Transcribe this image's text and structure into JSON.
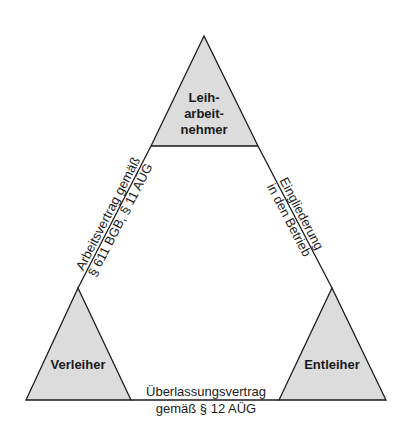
{
  "diagram": {
    "type": "triangle-relationship",
    "colors": {
      "node_fill": "#dcdcdc",
      "line": "#1a1a1a",
      "background": "#ffffff"
    },
    "nodes": [
      {
        "id": "leiharbeitnehmer",
        "lines": [
          "Leih-",
          "arbeit-",
          "nehmer"
        ]
      },
      {
        "id": "verleiher",
        "lines": [
          "Verleiher"
        ]
      },
      {
        "id": "entleiher",
        "lines": [
          "Entleiher"
        ]
      }
    ],
    "edges": [
      {
        "from": "leiharbeitnehmer",
        "to": "verleiher",
        "lines": [
          "Arbeitsvertrag gemäß",
          "§ 611 BGB, § 11 AÜG"
        ]
      },
      {
        "from": "leiharbeitnehmer",
        "to": "entleiher",
        "lines": [
          "Eingliederung",
          "in den Betrieb"
        ]
      },
      {
        "from": "verleiher",
        "to": "entleiher",
        "lines": [
          "Überlassungsvertrag",
          "gemäß § 12 AÜG"
        ]
      }
    ]
  }
}
